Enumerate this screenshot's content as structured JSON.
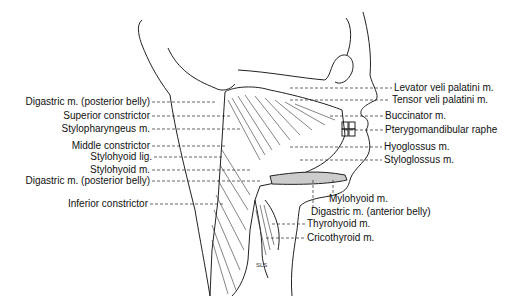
{
  "figure": {
    "type": "anatomical illustration",
    "signature": "SLS"
  },
  "labels_left": [
    {
      "text": "Digastric m. (posterior belly)",
      "right": 150,
      "y": 96
    },
    {
      "text": "Superior constrictor",
      "right": 150,
      "y": 110
    },
    {
      "text": "Stylopharyngeus m.",
      "right": 150,
      "y": 123
    },
    {
      "text": "Middle constrictor",
      "right": 150,
      "y": 140
    },
    {
      "text": "Stylohyoid lig.",
      "right": 152,
      "y": 151
    },
    {
      "text": "Stylohyoid m.",
      "right": 150,
      "y": 164
    },
    {
      "text": "Digastric m. (posterior belly)",
      "right": 150,
      "y": 175
    },
    {
      "text": "Inferior constrictor",
      "right": 148,
      "y": 198
    }
  ],
  "labels_right": [
    {
      "text": "Levator veli palatini m.",
      "x": 394,
      "y": 82
    },
    {
      "text": "Tensor veli palatini m.",
      "x": 392,
      "y": 94
    },
    {
      "text": "Buccinator m.",
      "x": 385,
      "y": 110
    },
    {
      "text": "Pterygomandibular raphe",
      "x": 385,
      "y": 124
    },
    {
      "text": "Hyoglossus m.",
      "x": 384,
      "y": 141
    },
    {
      "text": "Styloglossus m.",
      "x": 384,
      "y": 154
    }
  ],
  "labels_bottom": [
    {
      "text": "Mylohyoid m.",
      "x": 329,
      "y": 193
    },
    {
      "text": "Digastric m. (anterior belly)",
      "x": 311,
      "y": 206
    },
    {
      "text": "Thyrohyoid m.",
      "x": 307,
      "y": 218
    },
    {
      "text": "Cricothyroid m.",
      "x": 307,
      "y": 232
    }
  ]
}
